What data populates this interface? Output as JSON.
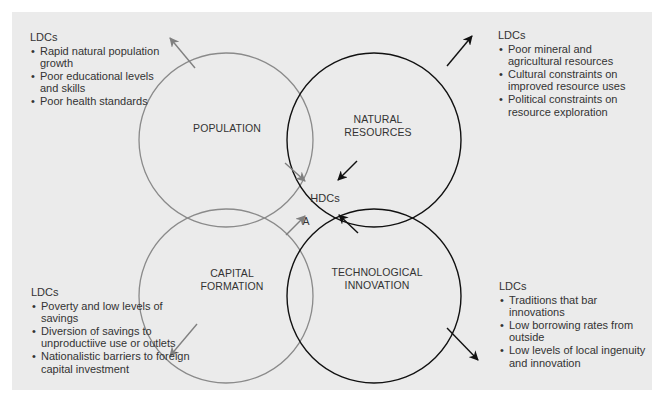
{
  "diagram": {
    "center_label": "HDCs",
    "marker_label": "A",
    "circles": [
      {
        "id": "population",
        "label_lines": [
          "POPULATION"
        ],
        "color": "#888888"
      },
      {
        "id": "natural-resources",
        "label_lines": [
          "NATURAL",
          "RESOURCES"
        ],
        "color": "#111111"
      },
      {
        "id": "capital-formation",
        "label_lines": [
          "CAPITAL",
          "FORMATION"
        ],
        "color": "#888888"
      },
      {
        "id": "technological-innovation",
        "label_lines": [
          "TECHNOLOGICAL",
          "INNOVATION"
        ],
        "color": "#111111"
      }
    ]
  },
  "blocks": {
    "top_left": {
      "heading": "LDCs",
      "items": [
        "Rapid natural population growth",
        "Poor educational levels and skills",
        "Poor health standards"
      ]
    },
    "top_right": {
      "heading": "LDCs",
      "items": [
        "Poor mineral and agricultural resources",
        "Cultural constraints on improved resource uses",
        "Political constraints on resource exploration"
      ]
    },
    "bottom_left": {
      "heading": "LDCs",
      "items": [
        "Poverty and low levels of savings",
        "Diversion of savings to unproductiive use or outlets",
        "Nationalistic barriers to foreign capital investment"
      ]
    },
    "bottom_right": {
      "heading": "LDCs",
      "items": [
        "Traditions that bar innovations",
        "Low borrowing rates from outside",
        "Low levels of local ingenuity and innovation"
      ]
    }
  }
}
